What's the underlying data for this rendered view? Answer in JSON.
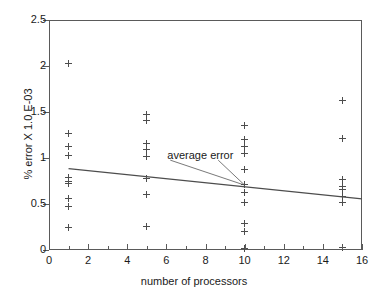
{
  "chart_data": {
    "type": "scatter",
    "title": "",
    "xlabel": "number of processors",
    "ylabel": "% error X 1.0 E-03",
    "xlim": [
      0,
      16
    ],
    "ylim": [
      0,
      2.5
    ],
    "grid": false,
    "legend": null,
    "xticks": [
      0,
      2,
      4,
      6,
      8,
      10,
      12,
      14,
      16
    ],
    "xticklabels": [
      "0",
      "2",
      "4",
      "6",
      "8",
      "10",
      "12",
      "14",
      "16"
    ],
    "xminorticks": [
      1,
      3,
      5,
      7,
      9,
      11,
      13,
      15
    ],
    "yticks": [
      0,
      0.5,
      1,
      1.5,
      2,
      2.5
    ],
    "yticklabels": [
      "0",
      "0.5",
      "1",
      "1.5",
      "2",
      "2.5"
    ],
    "series": [
      {
        "name": "error samples",
        "marker": "plus",
        "color": "#4d4d4d",
        "points": [
          {
            "x": 1,
            "y": 2.03
          },
          {
            "x": 1,
            "y": 1.27
          },
          {
            "x": 1,
            "y": 1.12
          },
          {
            "x": 1,
            "y": 1.03
          },
          {
            "x": 1,
            "y": 0.79
          },
          {
            "x": 1,
            "y": 0.75
          },
          {
            "x": 1,
            "y": 0.72
          },
          {
            "x": 1,
            "y": 0.56
          },
          {
            "x": 1,
            "y": 0.47
          },
          {
            "x": 1,
            "y": 0.25
          },
          {
            "x": 5,
            "y": 1.47
          },
          {
            "x": 5,
            "y": 1.41
          },
          {
            "x": 5,
            "y": 1.16
          },
          {
            "x": 5,
            "y": 1.09
          },
          {
            "x": 5,
            "y": 1.02
          },
          {
            "x": 5,
            "y": 0.78
          },
          {
            "x": 5,
            "y": 0.6
          },
          {
            "x": 5,
            "y": 0.26
          },
          {
            "x": 10,
            "y": 1.35
          },
          {
            "x": 10,
            "y": 1.2
          },
          {
            "x": 10,
            "y": 1.13
          },
          {
            "x": 10,
            "y": 1.05
          },
          {
            "x": 10,
            "y": 0.87
          },
          {
            "x": 10,
            "y": 0.71
          },
          {
            "x": 10,
            "y": 0.62
          },
          {
            "x": 10,
            "y": 0.52
          },
          {
            "x": 10,
            "y": 0.29
          },
          {
            "x": 10,
            "y": 0.2
          },
          {
            "x": 10,
            "y": 0.02
          },
          {
            "x": 15,
            "y": 1.63
          },
          {
            "x": 15,
            "y": 1.21
          },
          {
            "x": 15,
            "y": 0.77
          },
          {
            "x": 15,
            "y": 0.69
          },
          {
            "x": 15,
            "y": 0.66
          },
          {
            "x": 15,
            "y": 0.58
          },
          {
            "x": 15,
            "y": 0.52
          },
          {
            "x": 15,
            "y": 0.03
          }
        ]
      }
    ],
    "trendline": {
      "name": "average error",
      "color": "#4d4d4d",
      "x": [
        1.0,
        16.0
      ],
      "y": [
        0.885,
        0.555
      ]
    },
    "annotations": [
      {
        "text": "average error",
        "label_x": 6.05,
        "label_y": 1.02,
        "target_x": 10.0,
        "target_y": 0.705
      }
    ]
  }
}
